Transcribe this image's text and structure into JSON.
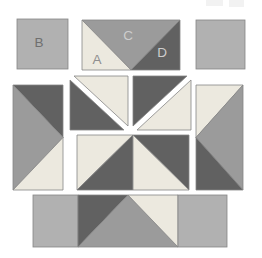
{
  "labels": {
    "a": "A",
    "b": "B",
    "c": "C",
    "d": "D"
  },
  "colors": {
    "background": "#ffffff",
    "square_gray": "#b1b1b1",
    "medium_gray": "#9b9b9b",
    "dark_gray": "#616161",
    "cream": "#ece9df",
    "outline": "#858585",
    "label_on_gray": "#6f6f6f",
    "label_on_light": "#8f8f8f",
    "label_light": "#cdcdcd",
    "artifact": "#f2f2f2"
  },
  "units": [
    {
      "id": "square-b",
      "kind": "plain square",
      "fill": "square_gray",
      "label": "B"
    },
    {
      "id": "top-flying-geese",
      "kind": "flying geese, point down",
      "pieces": [
        {
          "label": "A",
          "fill": "cream",
          "position": "bottom-left triangle"
        },
        {
          "label": "C",
          "fill": "medium_gray",
          "position": "large center triangle pointing down"
        },
        {
          "label": "D",
          "fill": "dark_gray",
          "position": "bottom-right triangle"
        }
      ]
    },
    {
      "id": "square-top-right",
      "kind": "plain square",
      "fill": "square_gray"
    },
    {
      "id": "left-flying-geese",
      "kind": "flying geese, point right",
      "fills": [
        "dark_gray",
        "medium_gray",
        "cream"
      ]
    },
    {
      "id": "hst-upper-left",
      "kind": "half-square triangle unit, exploded with gap, diagonal TL-BR",
      "fills": [
        "dark_gray",
        "cream"
      ]
    },
    {
      "id": "hst-upper-right",
      "kind": "half-square triangle unit, exploded with gap, diagonal BL-TR",
      "fills": [
        "dark_gray",
        "cream"
      ]
    },
    {
      "id": "hst-pair-lower",
      "kind": "two joined half-square triangle units",
      "fills": [
        "cream",
        "dark_gray",
        "dark_gray",
        "cream"
      ]
    },
    {
      "id": "right-flying-geese",
      "kind": "flying geese, point left",
      "fills": [
        "cream",
        "medium_gray",
        "dark_gray"
      ]
    },
    {
      "id": "bottom-strip",
      "kind": "square + flying geese point up + square",
      "fills": [
        "square_gray",
        "dark_gray",
        "medium_gray",
        "cream",
        "square_gray"
      ]
    }
  ]
}
